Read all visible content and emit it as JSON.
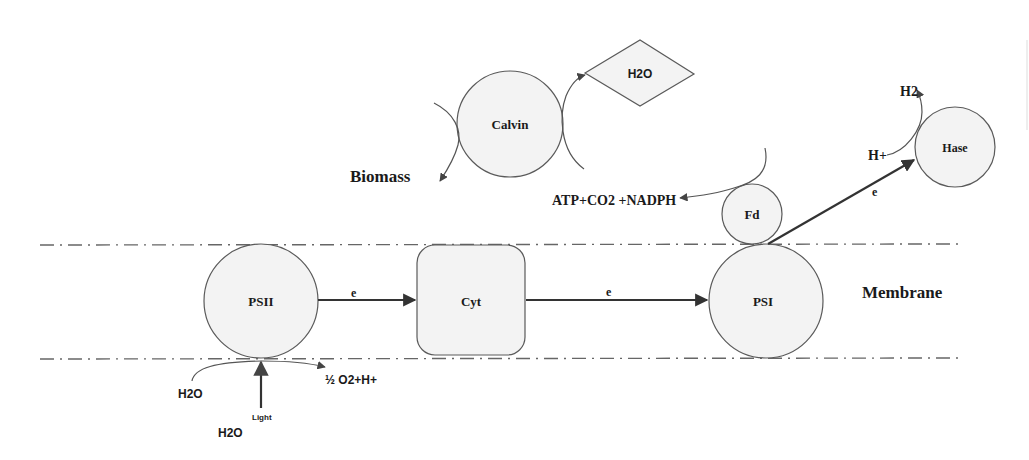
{
  "diagram": {
    "colors": {
      "node_fill": "#f3f3f3",
      "node_stroke": "#5a5a5a",
      "arrow": "#333333",
      "text": "#1a1a1a",
      "membrane_line": "#666666"
    },
    "membrane": {
      "label": "Membrane"
    },
    "nodes": {
      "psii": {
        "label": "PSII",
        "shape": "circle"
      },
      "cyt": {
        "label": "Cyt",
        "shape": "rounded-rect"
      },
      "psi": {
        "label": "PSI",
        "shape": "circle"
      },
      "fd": {
        "label": "Fd",
        "shape": "circle"
      },
      "hase": {
        "label": "Hase",
        "shape": "circle"
      },
      "calvin": {
        "label": "Calvin",
        "shape": "circle"
      },
      "h2o_top": {
        "label": "H2O",
        "shape": "diamond"
      }
    },
    "edges": {
      "psii_to_cyt": {
        "label": "e"
      },
      "cyt_to_psi": {
        "label": "e"
      },
      "fd_to_hase": {
        "label": "e"
      }
    },
    "labels": {
      "biomass": "Biomass",
      "atp_co2_nadph": "ATP+CO2 +NADPH",
      "h_plus": "H+",
      "h2": "H2",
      "h2o_left": "H2O",
      "h2o_bottom": "H2O",
      "light": "Light",
      "o2_h": "½ O2+H+"
    }
  }
}
